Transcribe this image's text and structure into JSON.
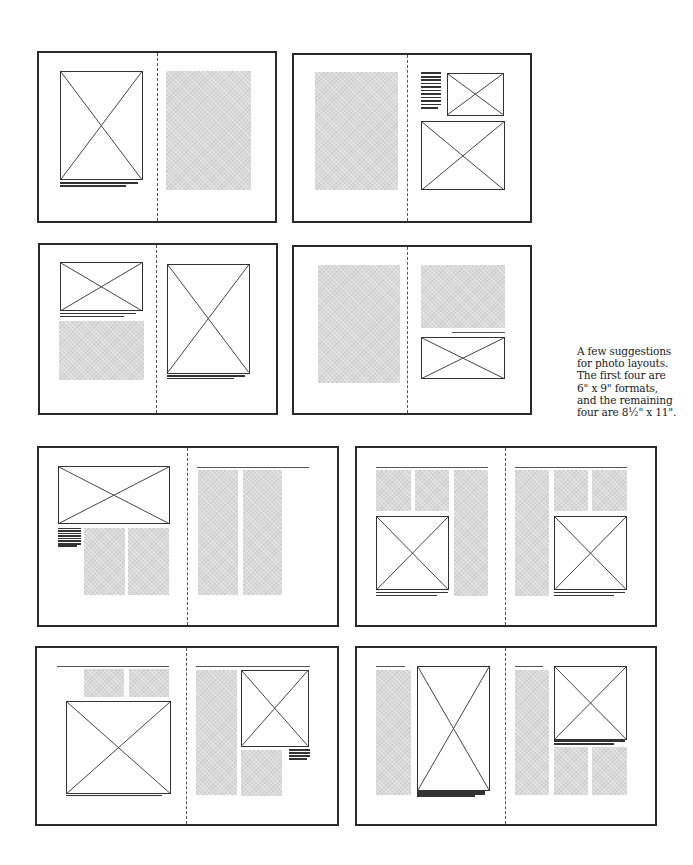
{
  "note": "A few suggestions\nfor photo layouts.\nThe first four are\n6\" x 9\" formats,\nand the remaining\nfour are 8½\" x 11\".",
  "legend": {
    "photo": "placeholder photo (box with X)",
    "text_block": "gray tint = body text column",
    "rule": "headline / rule line",
    "caption": "caption lines"
  },
  "spreads": [
    {
      "id": "6x9-1",
      "format": "6 x 9",
      "box": [
        37,
        51,
        240,
        172
      ],
      "gutter": 50,
      "elements": [
        {
          "type": "photo",
          "x": 9,
          "y": 10.5,
          "w": 35,
          "h": 65
        },
        {
          "type": "caption",
          "x": 9,
          "y": 77,
          "w": 33,
          "h": 2.5,
          "lines": 2
        },
        {
          "type": "text",
          "x": 54,
          "y": 10.5,
          "w": 36,
          "h": 71
        }
      ]
    },
    {
      "id": "6x9-2",
      "format": "6 x 9",
      "box": [
        292,
        53,
        240,
        170
      ],
      "gutter": 48,
      "elements": [
        {
          "type": "text",
          "x": 9,
          "y": 10.5,
          "w": 35,
          "h": 71
        },
        {
          "type": "lines",
          "x": 54,
          "y": 10.5,
          "w": 8.5,
          "h": 22,
          "lines": 11
        },
        {
          "type": "photo",
          "x": 65,
          "y": 11,
          "w": 24,
          "h": 25.5
        },
        {
          "type": "photo",
          "x": 54,
          "y": 39.5,
          "w": 35.5,
          "h": 42
        }
      ]
    },
    {
      "id": "6x9-3",
      "format": "6 x 9",
      "box": [
        38,
        243,
        240,
        172
      ],
      "gutter": 49,
      "elements": [
        {
          "type": "photo",
          "x": 8.5,
          "y": 10,
          "w": 35,
          "h": 29.5
        },
        {
          "type": "caption",
          "x": 8.5,
          "y": 40.5,
          "w": 32,
          "h": 2.5,
          "lines": 2
        },
        {
          "type": "text",
          "x": 8,
          "y": 45.5,
          "w": 36,
          "h": 35
        },
        {
          "type": "photo",
          "x": 54,
          "y": 11.5,
          "w": 35,
          "h": 65
        },
        {
          "type": "caption",
          "x": 54,
          "y": 77.5,
          "w": 33,
          "h": 2.5,
          "lines": 2
        }
      ]
    },
    {
      "id": "6x9-4",
      "format": "6 x 9",
      "box": [
        292,
        245,
        240,
        170
      ],
      "gutter": 48,
      "elements": [
        {
          "type": "text",
          "x": 10,
          "y": 11,
          "w": 35,
          "h": 71
        },
        {
          "type": "text",
          "x": 54,
          "y": 11,
          "w": 35.5,
          "h": 38
        },
        {
          "type": "rule",
          "x": 67,
          "y": 51.5,
          "w": 22.5
        },
        {
          "type": "photo",
          "x": 54,
          "y": 54,
          "w": 35.5,
          "h": 25.5
        }
      ]
    },
    {
      "id": "8.5x11-1",
      "format": "8½ x 11",
      "box": [
        37,
        446,
        302,
        181
      ],
      "gutter": 49.5,
      "elements": [
        {
          "type": "photo",
          "x": 6.5,
          "y": 10,
          "w": 37.5,
          "h": 33
        },
        {
          "type": "lines",
          "x": 6.5,
          "y": 45,
          "w": 7.5,
          "h": 11,
          "lines": 8
        },
        {
          "type": "text",
          "x": 15.2,
          "y": 45,
          "w": 13.5,
          "h": 38
        },
        {
          "type": "text",
          "x": 30,
          "y": 45,
          "w": 13.5,
          "h": 38
        },
        {
          "type": "rule",
          "x": 53,
          "y": 10.5,
          "w": 37.5
        },
        {
          "type": "text",
          "x": 53.2,
          "y": 12.5,
          "w": 13.5,
          "h": 70.5
        },
        {
          "type": "text",
          "x": 68.5,
          "y": 12.5,
          "w": 13,
          "h": 70.5
        }
      ]
    },
    {
      "id": "8.5x11-2",
      "format": "8½ x 11",
      "box": [
        355,
        446,
        302,
        181
      ],
      "gutter": 49.5,
      "elements": [
        {
          "type": "rule",
          "x": 6.5,
          "y": 10.5,
          "w": 37.5
        },
        {
          "type": "text",
          "x": 6.5,
          "y": 12.5,
          "w": 11.5,
          "h": 23
        },
        {
          "type": "text",
          "x": 19.5,
          "y": 12.5,
          "w": 11.5,
          "h": 23
        },
        {
          "type": "text",
          "x": 32.5,
          "y": 12.5,
          "w": 11.5,
          "h": 71
        },
        {
          "type": "photo",
          "x": 6.5,
          "y": 38.5,
          "w": 24.5,
          "h": 42
        },
        {
          "type": "caption",
          "x": 6.5,
          "y": 81.2,
          "w": 24,
          "h": 2.5,
          "lines": 2
        },
        {
          "type": "rule",
          "x": 53,
          "y": 10.5,
          "w": 37.5
        },
        {
          "type": "text",
          "x": 53,
          "y": 12.5,
          "w": 11.5,
          "h": 71
        },
        {
          "type": "text",
          "x": 66,
          "y": 12.5,
          "w": 11.5,
          "h": 23
        },
        {
          "type": "text",
          "x": 79,
          "y": 12.5,
          "w": 11.5,
          "h": 23
        },
        {
          "type": "photo",
          "x": 66,
          "y": 38.5,
          "w": 24.5,
          "h": 42
        },
        {
          "type": "caption",
          "x": 66,
          "y": 81.2,
          "w": 24,
          "h": 2.5,
          "lines": 2
        }
      ]
    },
    {
      "id": "8.5x11-3",
      "format": "8½ x 11",
      "box": [
        35,
        646,
        304,
        180
      ],
      "gutter": 49.5,
      "elements": [
        {
          "type": "rule",
          "x": 6.5,
          "y": 10,
          "w": 37.5
        },
        {
          "type": "text",
          "x": 15.5,
          "y": 12,
          "w": 13.5,
          "h": 16
        },
        {
          "type": "text",
          "x": 30.5,
          "y": 12,
          "w": 13.5,
          "h": 16
        },
        {
          "type": "photo",
          "x": 9.5,
          "y": 30,
          "w": 35,
          "h": 53
        },
        {
          "type": "caption",
          "x": 9.5,
          "y": 83.5,
          "w": 32,
          "h": 1,
          "lines": 1
        },
        {
          "type": "rule",
          "x": 53,
          "y": 10,
          "w": 38
        },
        {
          "type": "text",
          "x": 53,
          "y": 12.5,
          "w": 13.5,
          "h": 71
        },
        {
          "type": "photo",
          "x": 68,
          "y": 12.5,
          "w": 22.5,
          "h": 43.5
        },
        {
          "type": "lines",
          "x": 84,
          "y": 57.5,
          "w": 7,
          "h": 6,
          "lines": 4
        },
        {
          "type": "text",
          "x": 68,
          "y": 58,
          "w": 13.5,
          "h": 26
        }
      ]
    },
    {
      "id": "8.5x11-4",
      "format": "8½ x 11",
      "box": [
        355,
        646,
        302,
        180
      ],
      "gutter": 49.5,
      "elements": [
        {
          "type": "rule",
          "x": 6.5,
          "y": 10,
          "w": 9.5
        },
        {
          "type": "text",
          "x": 6.5,
          "y": 12.5,
          "w": 11.5,
          "h": 71
        },
        {
          "type": "photo",
          "x": 20,
          "y": 10,
          "w": 24.5,
          "h": 71
        },
        {
          "type": "caption",
          "x": 20,
          "y": 81.5,
          "w": 23,
          "h": 3,
          "lines": 3
        },
        {
          "type": "rule",
          "x": 53,
          "y": 10,
          "w": 9.5
        },
        {
          "type": "text",
          "x": 53,
          "y": 12.5,
          "w": 11.5,
          "h": 71
        },
        {
          "type": "photo",
          "x": 66,
          "y": 10,
          "w": 24.5,
          "h": 42
        },
        {
          "type": "caption",
          "x": 66,
          "y": 52.5,
          "w": 24,
          "h": 2.5,
          "lines": 2
        },
        {
          "type": "text",
          "x": 66,
          "y": 56.5,
          "w": 11.5,
          "h": 27
        },
        {
          "type": "text",
          "x": 79,
          "y": 56.5,
          "w": 11.5,
          "h": 27
        }
      ]
    }
  ]
}
